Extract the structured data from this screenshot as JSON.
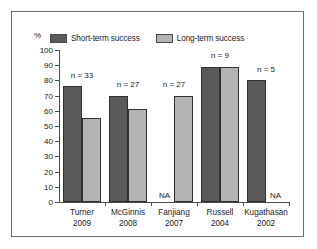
{
  "figure": {
    "unit_label": "%",
    "legend": [
      {
        "label": "Short-term success",
        "color": "#5a5a5a",
        "swatch_name": "legend-swatch-short-term"
      },
      {
        "label": "Long-term success",
        "color": "#b3b3b3",
        "swatch_name": "legend-swatch-long-term"
      }
    ]
  },
  "chart_data": {
    "type": "bar",
    "title": "",
    "xlabel": "",
    "ylabel": "%",
    "ylim": [
      0,
      100
    ],
    "yticks": [
      0,
      10,
      20,
      30,
      40,
      50,
      60,
      70,
      80,
      90,
      100
    ],
    "grid": false,
    "legend_position": "top",
    "categories": [
      "Turner\n2009",
      "McGinnis\n2008",
      "Fanjiang\n2007",
      "Russell\n2004",
      "Kugathasan\n2002"
    ],
    "category_labels": [
      {
        "name": "Turner",
        "year": "2009"
      },
      {
        "name": "McGinnis",
        "year": "2008"
      },
      {
        "name": "Fanjiang",
        "year": "2007"
      },
      {
        "name": "Russell",
        "year": "2004"
      },
      {
        "name": "Kugathasan",
        "year": "2002"
      }
    ],
    "series": [
      {
        "name": "Short-term success",
        "color": "#5a5a5a",
        "values": [
          76,
          70,
          null,
          89,
          80
        ]
      },
      {
        "name": "Long-term success",
        "color": "#b3b3b3",
        "values": [
          55,
          61,
          70,
          89,
          null
        ]
      }
    ],
    "annotations": [
      {
        "category": "Turner 2009",
        "text": "n = 33"
      },
      {
        "category": "McGinnis 2008",
        "text": "n = 27"
      },
      {
        "category": "Fanjiang 2007",
        "text": "n = 27"
      },
      {
        "category": "Russell 2004",
        "text": "n = 9"
      },
      {
        "category": "Kugathasan 2002",
        "text": "n = 5"
      }
    ],
    "missing_label": "NA"
  },
  "groups": [
    {
      "name": "Turner",
      "year": "2009",
      "n_label": "n = 33",
      "n_top_value": 83,
      "short": {
        "value": 76,
        "na": false
      },
      "long": {
        "value": 55,
        "na": false
      }
    },
    {
      "name": "McGinnis",
      "year": "2008",
      "n_label": "n = 27",
      "n_top_value": 77,
      "short": {
        "value": 70,
        "na": false
      },
      "long": {
        "value": 61,
        "na": false
      }
    },
    {
      "name": "Fanjiang",
      "year": "2007",
      "n_label": "n = 27",
      "n_top_value": 77,
      "short": {
        "value": null,
        "na": true,
        "na_text": "NA"
      },
      "long": {
        "value": 70,
        "na": false
      }
    },
    {
      "name": "Russell",
      "year": "2004",
      "n_label": "n = 9",
      "n_top_value": 96,
      "short": {
        "value": 89,
        "na": false
      },
      "long": {
        "value": 89,
        "na": false
      }
    },
    {
      "name": "Kugathasan",
      "year": "2002",
      "n_label": "n = 5",
      "n_top_value": 87,
      "short": {
        "value": 80,
        "na": false
      },
      "long": {
        "value": null,
        "na": true,
        "na_text": "NA"
      }
    }
  ]
}
